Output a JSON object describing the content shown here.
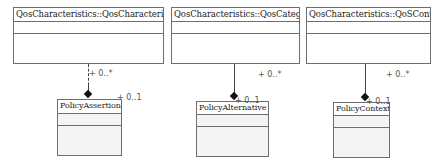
{
  "diagram": {
    "type": "UML class diagram",
    "classes": [
      {
        "name": "QosCharacteristics::QosCharacteristic"
      },
      {
        "name": "QosCharacteristics::QosCategory"
      },
      {
        "name": "QosCharacteristics::QoSContext"
      },
      {
        "name": "PolicyAssertion"
      },
      {
        "name": "PolicyAlternative"
      },
      {
        "name": "PolicyContext"
      }
    ],
    "associations": [
      {
        "from": "QosCharacteristics::QosCharacteristic",
        "to": "PolicyAssertion",
        "kind": "composition",
        "source_multiplicity": "+ 0..*",
        "target_multiplicity": "+ 0..1"
      },
      {
        "from": "QosCharacteristics::QosCategory",
        "to": "PolicyAlternative",
        "kind": "composition",
        "source_multiplicity": "+ 0..*",
        "target_multiplicity": "+ 0..1"
      },
      {
        "from": "QosCharacteristics::QoSContext",
        "to": "PolicyContext",
        "kind": "composition",
        "source_multiplicity": "+ 0..*",
        "target_multiplicity": "+ 0..1"
      }
    ]
  }
}
